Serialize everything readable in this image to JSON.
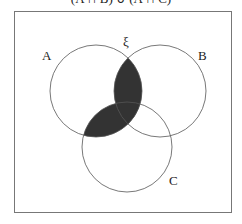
{
  "caption": "(A ∩ B) ∪ (A ∩ C)",
  "diagram": {
    "type": "venn",
    "universal_label": "ξ",
    "sets": [
      {
        "label": "A",
        "cx": 96,
        "cy": 91,
        "r": 46
      },
      {
        "label": "B",
        "cx": 160,
        "cy": 91,
        "r": 46
      },
      {
        "label": "C",
        "cx": 127,
        "cy": 147,
        "r": 45
      }
    ],
    "shaded_region": "(A ∩ B) ∪ (A ∩ C)",
    "shade_color": "#333333",
    "line_color": "#555555"
  }
}
